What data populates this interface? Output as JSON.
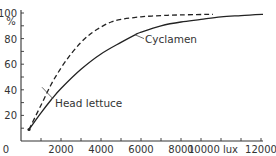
{
  "chart_data": {
    "type": "line",
    "title": "",
    "xlabel": "lux",
    "ylabel": "%",
    "xlim": [
      0,
      12000
    ],
    "ylim": [
      0,
      100
    ],
    "grid": false,
    "legend": "inline annotations",
    "x_ticks": [
      0,
      2000,
      4000,
      6000,
      8000,
      10000,
      12000
    ],
    "x_tick_labels": [
      "0",
      "2000",
      "4000",
      "6000",
      "8000",
      "10000 lux",
      "12000"
    ],
    "x_minor_tick_step": 1000,
    "y_ticks": [
      20,
      40,
      60,
      80,
      100
    ],
    "y_tick_labels": [
      "20",
      "40",
      "60",
      "80",
      "100"
    ],
    "y_minor_tick_step": 10,
    "series": [
      {
        "name": "Head lettuce",
        "style": "dashed",
        "x": [
          400,
          1000,
          1500,
          2000,
          2500,
          3000,
          3500,
          4000,
          4500,
          5000,
          6000,
          7000,
          8000,
          9600
        ],
        "y": [
          9,
          28,
          44,
          57,
          68,
          77,
          84,
          89,
          93,
          95,
          97,
          98,
          98.5,
          99
        ]
      },
      {
        "name": "Cyclamen",
        "style": "solid",
        "x": [
          400,
          1000,
          1500,
          2000,
          3000,
          4000,
          5000,
          5700,
          6000,
          7000,
          8000,
          9000,
          10000,
          11000,
          12100
        ],
        "y": [
          9,
          22,
          32,
          41,
          56,
          68,
          77,
          83,
          85,
          90,
          93,
          95,
          97,
          98,
          99
        ]
      }
    ],
    "annotations": [
      {
        "text": "Cyclamen",
        "target_series": "Cyclamen",
        "pointer_at": [
          5700,
          83
        ]
      },
      {
        "text": "Head lettuce",
        "target_series": "Head lettuce",
        "pointer_at": [
          1100,
          37
        ]
      }
    ]
  },
  "labels": {
    "y_unit": "%",
    "cyclamen": "Cyclamen",
    "head_lettuce": "Head lettuce"
  }
}
